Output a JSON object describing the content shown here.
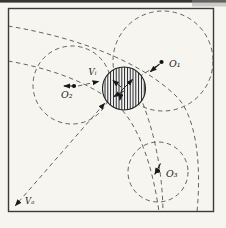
{
  "figure": {
    "labels": {
      "o1": "O₁",
      "o2": "O₂",
      "o3": "O₃",
      "v_i": "Vᵢ",
      "v_a": "Vₐ"
    },
    "colors": {
      "paper": "#f7f5f0",
      "frame": "#3b3b3b",
      "dashed_line": "#525252",
      "ink": "#1a1a1a",
      "scan_bar": "#141414"
    }
  }
}
